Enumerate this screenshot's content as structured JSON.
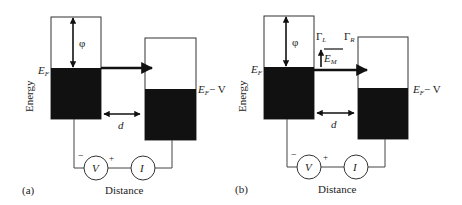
{
  "panels": [
    {
      "id": "a",
      "tag": "(a)",
      "y_axis_label": "Energy",
      "x_axis_label": "Distance",
      "work_function": "φ",
      "fermi_left": "E",
      "fermi_left_sub": "F",
      "fermi_right": "E",
      "fermi_right_sub": "F",
      "fermi_right_suffix": "− V",
      "gap_label": "d",
      "voltmeter": "V",
      "ammeter": "I",
      "minus": "−",
      "plus": "+"
    },
    {
      "id": "b",
      "tag": "(b)",
      "y_axis_label": "Energy",
      "x_axis_label": "Distance",
      "work_function": "φ",
      "fermi_left": "E",
      "fermi_left_sub": "F",
      "fermi_right": "E",
      "fermi_right_sub": "F",
      "fermi_right_suffix": "− V",
      "gap_label": "d",
      "voltmeter": "V",
      "ammeter": "I",
      "minus": "−",
      "plus": "+",
      "gamma_left": "Γ",
      "gamma_left_sub": "L",
      "gamma_right": "Γ",
      "gamma_right_sub": "R",
      "level": "E",
      "level_sub": "M"
    }
  ]
}
